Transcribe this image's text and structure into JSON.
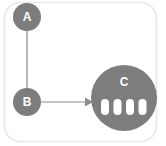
{
  "canvas": {
    "width": 166,
    "height": 146,
    "background": "#ffffff"
  },
  "container": {
    "name": "diagram-frame",
    "border_color": "#e8e8e8",
    "fill": "#ffffff",
    "x": 4,
    "y": 2,
    "width": 153,
    "height": 140,
    "corner_radius": 16
  },
  "style": {
    "node_fill": "#7d7d7d",
    "node_label_color": "#ffffff",
    "edge_color": "#8c8c8c",
    "slot_fill": "#ffffff"
  },
  "nodes": [
    {
      "id": "A",
      "label": "A",
      "shape": "circle",
      "cx": 27,
      "cy": 17,
      "r": 14,
      "fill": "#7d7d7d",
      "font_size": 12
    },
    {
      "id": "B",
      "label": "B",
      "shape": "circle",
      "cx": 27,
      "cy": 102,
      "r": 14,
      "fill": "#7d7d7d",
      "font_size": 12
    },
    {
      "id": "C",
      "label": "C",
      "shape": "circle",
      "cx": 124,
      "cy": 98,
      "r": 33,
      "fill": "#7d7d7d",
      "font_size": 12,
      "label_cy": 82
    }
  ],
  "node_c_slots": [
    {
      "name": "slot-1",
      "x": 101,
      "y": 99,
      "width": 8,
      "height": 16,
      "rx": 4
    },
    {
      "name": "slot-2",
      "x": 114,
      "y": 99,
      "width": 8,
      "height": 16,
      "rx": 4
    },
    {
      "name": "slot-3",
      "x": 126,
      "y": 99,
      "width": 8,
      "height": 16,
      "rx": 4
    },
    {
      "name": "slot-4",
      "x": 139,
      "y": 99,
      "width": 8,
      "height": 16,
      "rx": 4
    }
  ],
  "edges": [
    {
      "id": "A-B",
      "from": "A",
      "to": "B",
      "arrow": false,
      "path": "M 27 31 L 27 88",
      "stroke": "#8c8c8c",
      "stroke_width": 1.2
    },
    {
      "id": "B-C",
      "from": "B",
      "to": "C",
      "arrow": true,
      "path": "M 41 102 L 86 102",
      "stroke": "#8c8c8c",
      "stroke_width": 1.2,
      "arrowhead_points": "86,98 93,102 86,106"
    }
  ]
}
